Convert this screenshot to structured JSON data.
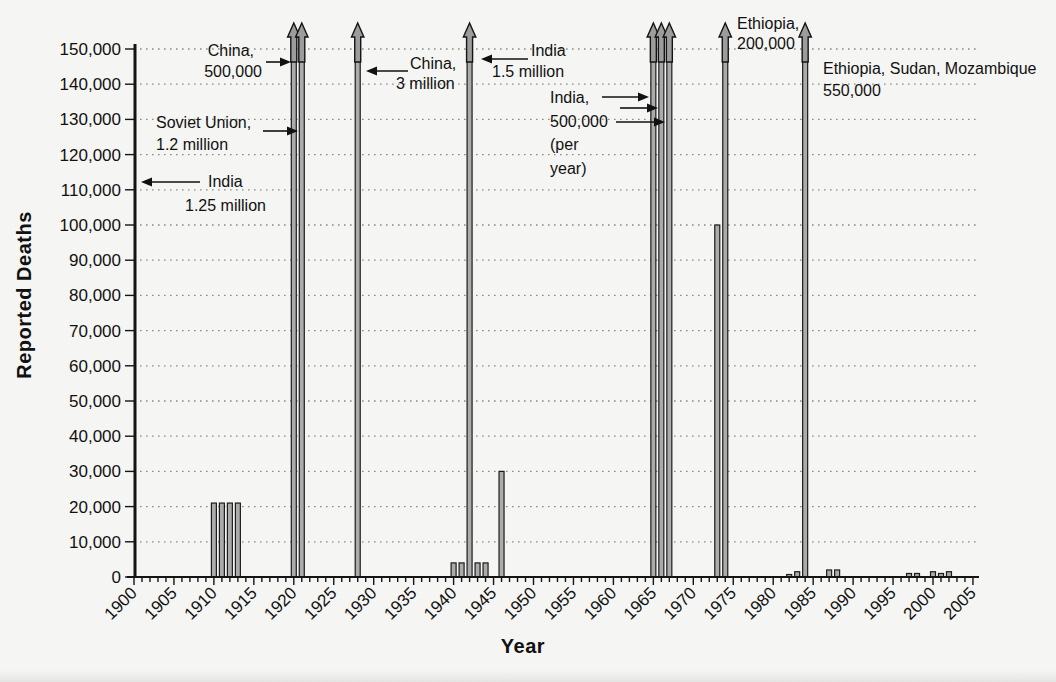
{
  "figure": {
    "ylabel": "Reported Deaths",
    "xlabel": "Year"
  },
  "chart_data": {
    "type": "bar",
    "title": "",
    "xlabel": "Year",
    "ylabel": "Reported Deaths",
    "x_range": [
      1900,
      2005
    ],
    "ylim": [
      0,
      150000
    ],
    "y_tick_step": 10000,
    "y_tick_labels": [
      "0",
      "10,000",
      "20,000",
      "30,000",
      "40,000",
      "50,000",
      "60,000",
      "70,000",
      "80,000",
      "90,000",
      "100,000",
      "110,000",
      "120,000",
      "130,000",
      "140,000",
      "150,000"
    ],
    "x_tick_labels": [
      "1900",
      "1905",
      "1910",
      "1915",
      "1920",
      "1925",
      "1930",
      "1935",
      "1940",
      "1945",
      "1950",
      "1955",
      "1960",
      "1965",
      "1970",
      "1975",
      "1980",
      "1985",
      "1990",
      "1995",
      "2000",
      "2005"
    ],
    "grid": "horizontal dotted lines at every 10,000",
    "legend": "none",
    "off_scale_marker": "bars topped with an up-arrow exceed the 150,000 axis maximum",
    "bars": [
      {
        "year": 1910,
        "value": 21000
      },
      {
        "year": 1911,
        "value": 21000
      },
      {
        "year": 1912,
        "value": 21000
      },
      {
        "year": 1913,
        "value": 21000
      },
      {
        "year": 1920,
        "value": 150000,
        "capped": true,
        "actual_deaths": 500000,
        "event": "China"
      },
      {
        "year": 1921,
        "value": 150000,
        "capped": true,
        "actual_deaths": 1200000,
        "event": "Soviet Union"
      },
      {
        "year": 1928,
        "value": 150000,
        "capped": true,
        "actual_deaths": 3000000,
        "event": "China"
      },
      {
        "year": 1940,
        "value": 4000
      },
      {
        "year": 1941,
        "value": 4000
      },
      {
        "year": 1942,
        "value": 150000,
        "capped": true,
        "actual_deaths": 1500000,
        "event": "India"
      },
      {
        "year": 1943,
        "value": 4000
      },
      {
        "year": 1944,
        "value": 4000
      },
      {
        "year": 1946,
        "value": 30000
      },
      {
        "year": 1965,
        "value": 150000,
        "capped": true,
        "actual_deaths": 500000,
        "event": "India (per year)"
      },
      {
        "year": 1966,
        "value": 150000,
        "capped": true,
        "actual_deaths": 500000,
        "event": "India (per year)"
      },
      {
        "year": 1967,
        "value": 150000,
        "capped": true,
        "actual_deaths": 500000,
        "event": "India (per year)"
      },
      {
        "year": 1973,
        "value": 100000
      },
      {
        "year": 1974,
        "value": 150000,
        "capped": true,
        "actual_deaths": 200000,
        "event": "Ethiopia"
      },
      {
        "year": 1982,
        "value": 700
      },
      {
        "year": 1983,
        "value": 1500
      },
      {
        "year": 1984,
        "value": 150000,
        "capped": true,
        "actual_deaths": 550000,
        "event": "Ethiopia, Sudan, Mozambique"
      },
      {
        "year": 1987,
        "value": 2000
      },
      {
        "year": 1988,
        "value": 2000
      },
      {
        "year": 1997,
        "value": 1000
      },
      {
        "year": 1998,
        "value": 1000
      },
      {
        "year": 2000,
        "value": 1500
      },
      {
        "year": 2001,
        "value": 1000
      },
      {
        "year": 2002,
        "value": 1500
      }
    ],
    "annotations": [
      {
        "id": "china-1920",
        "target_year": 1920,
        "deaths": "500,000",
        "lines": [
          "China,",
          "500,000"
        ],
        "align": "end",
        "x": 262,
        "y": 56,
        "dx": [
          -8,
          0
        ],
        "lh": 21,
        "arrows": [
          {
            "x1": 266,
            "y1": 62,
            "x2": 291,
            "y2": 62
          }
        ]
      },
      {
        "id": "soviet-union-1921",
        "target_year": 1921,
        "deaths": "1.2 million",
        "lines": [
          "Soviet Union,",
          "1.2 million"
        ],
        "align": "start",
        "x": 156,
        "y": 128,
        "lh": 22,
        "arrows": [
          {
            "x1": 263,
            "y1": 131,
            "x2": 298,
            "y2": 131
          }
        ]
      },
      {
        "id": "india-1900",
        "target_year": 1900,
        "deaths": "1.25 million",
        "lines": [
          "India",
          "1.25 million"
        ],
        "align": "start",
        "x": 185,
        "y": 187,
        "dx": [
          23,
          0
        ],
        "lh": 24,
        "arrows": [
          {
            "x1": 200,
            "y1": 182,
            "x2": 141,
            "y2": 182
          }
        ]
      },
      {
        "id": "china-1928",
        "target_year": 1928,
        "deaths": "3 million",
        "lines": [
          "China,",
          "3 million"
        ],
        "align": "start",
        "x": 396,
        "y": 69,
        "dx": [
          14,
          0
        ],
        "lh": 20,
        "arrows": [
          {
            "x1": 408,
            "y1": 71,
            "x2": 366,
            "y2": 71
          }
        ]
      },
      {
        "id": "india-1942",
        "target_year": 1942,
        "deaths": "1.5 million",
        "lines": [
          "India",
          "1.5 million"
        ],
        "align": "start",
        "x": 492,
        "y": 56,
        "dx": [
          39,
          0
        ],
        "lh": 21,
        "arrows": [
          {
            "x1": 528,
            "y1": 59,
            "x2": 481,
            "y2": 59
          }
        ]
      },
      {
        "id": "india-1965-67",
        "target_year": 1965,
        "deaths": "500,000 per year",
        "lines": [
          "India,",
          "500,000",
          "(per",
          "year)"
        ],
        "align": "start",
        "x": 550,
        "y": 103,
        "lh": 23.5,
        "arrows": [
          {
            "x1": 602,
            "y1": 97,
            "x2": 649,
            "y2": 97
          },
          {
            "x1": 620,
            "y1": 108,
            "x2": 658,
            "y2": 108
          },
          {
            "x1": 616,
            "y1": 122,
            "x2": 665,
            "y2": 122
          }
        ]
      },
      {
        "id": "ethiopia-1974",
        "target_year": 1974,
        "deaths": "200,000",
        "lines": [
          "Ethiopia,",
          "200,000"
        ],
        "align": "start",
        "x": 737,
        "y": 29,
        "lh": 20,
        "arrows": []
      },
      {
        "id": "ethiopia-sudan-mozambique-1984",
        "target_year": 1984,
        "deaths": "550,000",
        "lines": [
          "Ethiopia, Sudan, Mozambique",
          "550,000"
        ],
        "align": "start",
        "x": 823,
        "y": 74,
        "lh": 22,
        "arrows": []
      }
    ]
  }
}
